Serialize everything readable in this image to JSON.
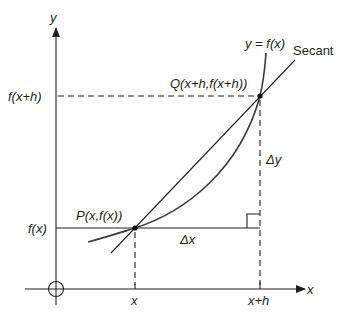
{
  "diagram": {
    "axis_labels": {
      "x": "x",
      "y": "y"
    },
    "curve_label": "y = f(x)",
    "secant_label": "Secant",
    "point_p_label": "P(x,f(x))",
    "point_q_label": "Q(x+h,f(x+h))",
    "y_tick_fxh": "f(x+h)",
    "y_tick_fx": "f(x)",
    "x_tick_x": "x",
    "x_tick_xh": "x+h",
    "delta_x": "Δx",
    "delta_y": "Δy",
    "colors": {
      "ink": "#231f20",
      "curve": "#3a3a3a",
      "background": "#ffffff"
    }
  }
}
